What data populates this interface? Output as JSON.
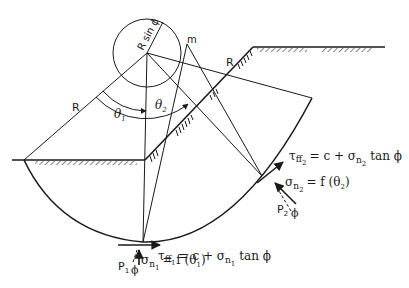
{
  "diagram": {
    "labels": {
      "radius_left": "R",
      "radius_right": "R",
      "r_sin_phi": "R sin ϕ",
      "point_m": "m",
      "theta1": "θ",
      "theta1_sub": "1",
      "theta2": "θ",
      "theta2_sub": "2"
    },
    "equations": {
      "tau_ff2": {
        "lhs": "τ",
        "lhs_sub": "ff",
        "lhs_subsub": "2",
        "rhs": "= c + σ",
        "rhs_sub": "n",
        "rhs_subsub": "2",
        "tail": "tan ϕ"
      },
      "sigma_n2": {
        "lhs": "σ",
        "lhs_sub": "n",
        "lhs_subsub": "2",
        "rhs": "= f (θ",
        "rhs_sub": "2",
        "close": ")"
      },
      "tau_ff1": {
        "lhs": "τ",
        "lhs_sub": "ff",
        "lhs_subsub": "1",
        "rhs": "= c + σ",
        "rhs_sub": "n",
        "rhs_subsub": "1",
        "tail": "tan ϕ"
      },
      "sigma_n1": {
        "lhs": "σ",
        "lhs_sub": "n",
        "lhs_subsub": "1",
        "rhs": "= f (θ",
        "rhs_sub": "1",
        "close": ")"
      }
    },
    "forces": {
      "p1": "P",
      "p1_sub": "1",
      "p2": "P",
      "p2_sub": "2",
      "phi1": "ϕ",
      "phi2": "ϕ"
    }
  }
}
